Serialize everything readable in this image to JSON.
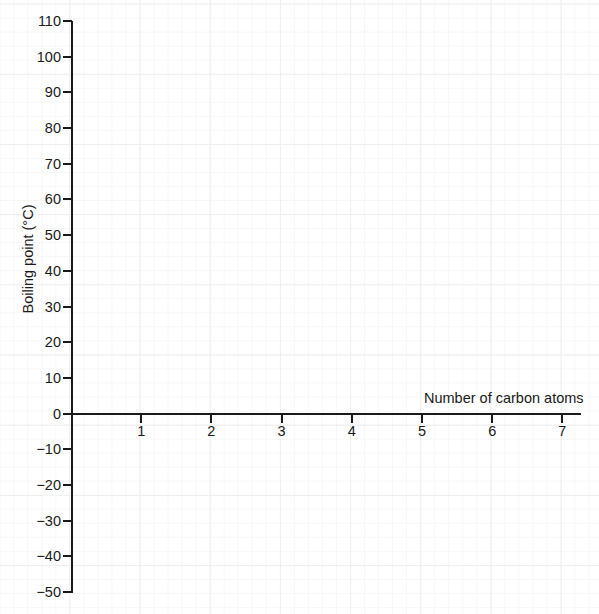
{
  "chart_data": {
    "type": "line",
    "title": "",
    "subtitle": "",
    "xlabel": "Number of carbon atoms",
    "ylabel": "Boiling point (°C)",
    "xlim": [
      0,
      7.3
    ],
    "ylim": [
      -50,
      110
    ],
    "xticks": [
      1,
      2,
      3,
      4,
      5,
      6,
      7
    ],
    "xtick_labels": [
      "1",
      "2",
      "3",
      "4",
      "5",
      "6",
      "7"
    ],
    "yticks": [
      110,
      100,
      90,
      80,
      70,
      60,
      50,
      40,
      30,
      20,
      10,
      0,
      -10,
      -20,
      -30,
      -40,
      -50
    ],
    "ytick_labels": [
      "110",
      "100",
      "90",
      "80",
      "70",
      "60",
      "50",
      "40",
      "30",
      "20",
      "10",
      "0",
      "−10",
      "−20",
      "−30",
      "−40",
      "−50"
    ],
    "grid": true,
    "grid_major_step_x": 1,
    "grid_major_step_y": 10,
    "grid_minor_divisions": 5,
    "legend": null,
    "series": [],
    "values": [],
    "annotations": [],
    "colors": {
      "background": "#ffffff",
      "axis": "#1a1a1a",
      "grid_major": "#eeeeee",
      "grid_minor": "#f7f7f7",
      "text": "#1a1a1a"
    }
  }
}
